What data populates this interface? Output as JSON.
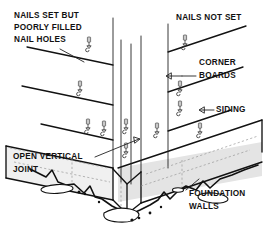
{
  "figure": {
    "background_color": "#ffffff",
    "ink_color": "#111111",
    "width": 267,
    "height": 242
  },
  "labels": {
    "nails_set": {
      "line1": "NAILS SET BUT",
      "line2": "POORLY FILLED",
      "line3": "NAIL HOLES"
    },
    "nails_not_set": {
      "line1": "NAILS NOT SET"
    },
    "corner_boards": {
      "line1": "CORNER",
      "line2": "BOARDS"
    },
    "siding": {
      "line1": "SIDING"
    },
    "open_joint": {
      "line1": "OPEN VERTICAL",
      "line2": "JOINT"
    },
    "foundation": {
      "line1": "FOUNDATION",
      "line2": "WALLS"
    }
  },
  "callouts": {
    "corner_boards_arrow": "left-pointing-arrow",
    "siding_arrow": "left-pointing-arrow",
    "open_joint_arrow": "right-pointing-arrow",
    "foundation_leader": "leader-line"
  },
  "symbols": {
    "nail_count_left": 4,
    "nail_count_center": 2,
    "nail_count_right": 4,
    "nail_glyph": "downward-nail-arrow"
  }
}
